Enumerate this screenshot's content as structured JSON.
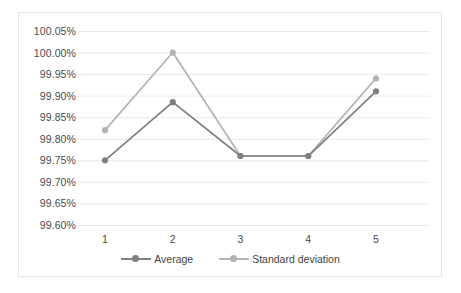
{
  "chart_data": {
    "type": "line",
    "title": "",
    "xlabel": "",
    "ylabel": "",
    "categories": [
      "1",
      "2",
      "3",
      "4",
      "5"
    ],
    "ylim": [
      99.6,
      100.05
    ],
    "ytick_labels": [
      "100.05%",
      "100.00%",
      "99.95%",
      "99.90%",
      "99.85%",
      "99.80%",
      "99.75%",
      "99.70%",
      "99.65%",
      "99.60%"
    ],
    "ytick_values": [
      100.05,
      100.0,
      99.95,
      99.9,
      99.85,
      99.8,
      99.75,
      99.7,
      99.65,
      99.6
    ],
    "grid": true,
    "legend_position": "bottom",
    "series": [
      {
        "name": "Average",
        "color": "#7f7f7f",
        "values": [
          99.75,
          99.885,
          99.76,
          99.76,
          99.91
        ]
      },
      {
        "name": "Standard deviation",
        "color": "#b3b3b3",
        "values": [
          99.82,
          100.0,
          99.76,
          99.76,
          99.94
        ]
      }
    ]
  },
  "colors": {
    "average": "#7f7f7f",
    "standard_deviation": "#b3b3b3",
    "gridline": "#e8e8e8",
    "border": "#e3e3e3",
    "tick_text": "#4a4a4a"
  }
}
